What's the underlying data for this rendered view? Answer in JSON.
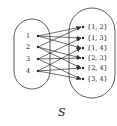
{
  "diagram": {
    "caption": "S",
    "colors": {
      "stroke": "#333333",
      "text": "#222222",
      "background": "#ffffff"
    },
    "domain_set": {
      "elements": [
        "1",
        "2",
        "3",
        "4"
      ]
    },
    "codomain_set": {
      "elements": [
        "{1, 2}",
        "{1, 3}",
        "{1, 4}",
        "{2, 3}",
        "{2, 4}",
        "{3, 4}"
      ]
    },
    "arrows": [
      {
        "from": "1",
        "to": "{1, 2}"
      },
      {
        "from": "1",
        "to": "{1, 3}"
      },
      {
        "from": "1",
        "to": "{1, 4}"
      },
      {
        "from": "2",
        "to": "{1, 2}"
      },
      {
        "from": "2",
        "to": "{2, 3}"
      },
      {
        "from": "2",
        "to": "{2, 4}"
      },
      {
        "from": "3",
        "to": "{1, 3}"
      },
      {
        "from": "3",
        "to": "{2, 3}"
      },
      {
        "from": "3",
        "to": "{3, 4}"
      },
      {
        "from": "4",
        "to": "{1, 4}"
      },
      {
        "from": "4",
        "to": "{2, 4}"
      },
      {
        "from": "4",
        "to": "{3, 4}"
      }
    ]
  }
}
